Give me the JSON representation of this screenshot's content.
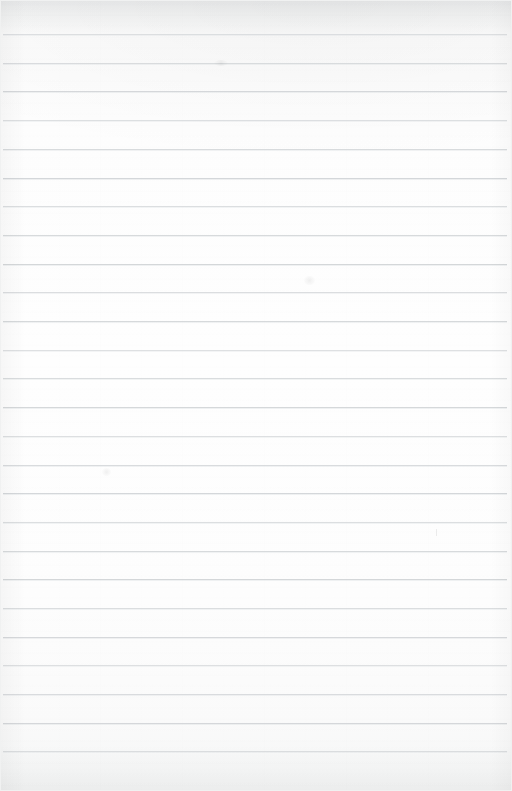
{
  "document": {
    "kind": "scanned-page",
    "title": "Blank Ruled Notebook Page",
    "content_text": "",
    "page_width": 512,
    "page_height": 791,
    "orientation": "portrait",
    "is_blank": "true",
    "paper": {
      "type": "ruled-notebook-paper",
      "background_color": "#fdfdfd",
      "top_shade_color": "#f2f3f4",
      "bottom_shade_color": "#f2f3f3"
    },
    "ruling": {
      "style": "horizontal-wide-ruled",
      "line_color": "#d2d5d8",
      "line_thickness_px": 1,
      "line_spacing_px": 28.7,
      "first_line_y": 34,
      "last_line_y": 751,
      "line_left_x": 3,
      "line_right_x": 507,
      "line_count": 26,
      "margin_rule": "none",
      "line_y_positions": [
        34,
        62.7,
        91.4,
        120.1,
        148.8,
        177.5,
        206.2,
        234.9,
        263.6,
        292.3,
        321,
        349.7,
        378.4,
        407.1,
        435.8,
        464.5,
        493.2,
        521.9,
        550.6,
        579.3,
        608,
        636.7,
        665.4,
        694.1,
        722.8,
        751
      ]
    },
    "marks": [
      {
        "name": "faint-pencil-tick",
        "x": 436,
        "y": 529,
        "width": 1,
        "height": 7,
        "kind": "tick"
      },
      {
        "name": "faint-smudge-left",
        "x": 102,
        "y": 468,
        "width": 9,
        "height": 8,
        "kind": "smudge"
      },
      {
        "name": "faint-smudge-mid",
        "x": 304,
        "y": 276,
        "width": 11,
        "height": 9,
        "kind": "smudge"
      },
      {
        "name": "faint-smudge-upper",
        "x": 214,
        "y": 60,
        "width": 14,
        "height": 6,
        "kind": "smudge"
      }
    ]
  }
}
